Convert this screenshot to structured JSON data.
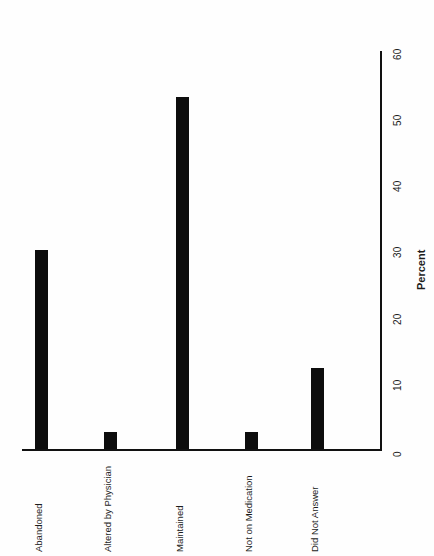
{
  "chart_data": {
    "type": "bar",
    "title": "",
    "subtitle": "",
    "xlabel": "",
    "ylabel": "Percent",
    "orientation": "vertical-bars-rotated-90",
    "grid": false,
    "legend": "none",
    "categories": [
      "Abandoned",
      "Altered by Physician",
      "Maintained",
      "Not on Medication",
      "Did Not Answer"
    ],
    "values": [
      30.0,
      2.6,
      53.0,
      2.6,
      12.2
    ],
    "ylim": [
      0,
      63
    ],
    "yticks": [
      0,
      10,
      20,
      30,
      40,
      50,
      60
    ],
    "ytick_labels": [
      "0",
      "10",
      "20",
      "30",
      "40",
      "50",
      "60"
    ],
    "bar_color": "#0d0d0d",
    "axis_color": "#111111",
    "background_color": "#ffffff"
  },
  "axis": {
    "value_axis_title": "Percent",
    "ticks": [
      {
        "label": "0",
        "value": 0
      },
      {
        "label": "10",
        "value": 10
      },
      {
        "label": "20",
        "value": 20
      },
      {
        "label": "30",
        "value": 30
      },
      {
        "label": "40",
        "value": 40
      },
      {
        "label": "50",
        "value": 50
      },
      {
        "label": "60",
        "value": 60
      }
    ]
  },
  "bars": [
    {
      "label": "Abandoned",
      "value": 30.0
    },
    {
      "label": "Altered by Physician",
      "value": 2.6
    },
    {
      "label": "Maintained",
      "value": 53.0
    },
    {
      "label": "Not on Medication",
      "value": 2.6
    },
    {
      "label": "Did Not Answer",
      "value": 12.2
    }
  ]
}
